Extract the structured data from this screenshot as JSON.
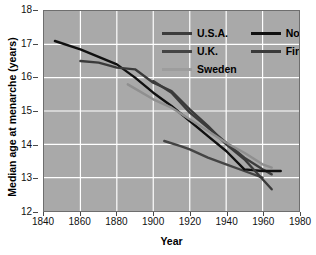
{
  "chart_data": {
    "type": "line",
    "title": "",
    "xlabel": "Year",
    "ylabel": "Median age at menarche (years)",
    "xlim": [
      1840,
      1980
    ],
    "ylim": [
      12,
      18
    ],
    "xticks": [
      1840,
      1860,
      1880,
      1900,
      1920,
      1940,
      1960,
      1980
    ],
    "yticks": [
      12,
      13,
      14,
      15,
      16,
      17,
      18
    ],
    "grid": true,
    "legend_position": "upper right (inside plot)",
    "plot_background": "#a9a9a9",
    "grid_color": "#ffffff",
    "series": [
      {
        "name": "U.S.A.",
        "color": "#3c3c3c",
        "x": [
          1900,
          1910,
          1920,
          1930,
          1940,
          1950,
          1960,
          1965
        ],
        "values": [
          15.9,
          15.55,
          14.95,
          14.5,
          14.05,
          13.6,
          13.25,
          13.1
        ]
      },
      {
        "name": "U.K.",
        "color": "#444444",
        "x": [
          1906,
          1915,
          1920,
          1930,
          1940,
          1950,
          1960
        ],
        "values": [
          14.1,
          13.95,
          13.85,
          13.6,
          13.4,
          13.2,
          13.0
        ]
      },
      {
        "name": "Norway",
        "color": "#101010",
        "x": [
          1846,
          1860,
          1880,
          1890,
          1900,
          1910,
          1920,
          1930,
          1940,
          1950,
          1960,
          1970
        ],
        "values": [
          17.1,
          16.85,
          16.4,
          16.0,
          15.55,
          15.15,
          14.7,
          14.25,
          13.8,
          13.25,
          13.2,
          13.2
        ]
      },
      {
        "name": "Finland",
        "color": "#3a3a3a",
        "x": [
          1860,
          1870,
          1880,
          1890,
          1900,
          1910,
          1920,
          1930,
          1940,
          1950,
          1960,
          1965
        ],
        "values": [
          16.5,
          16.45,
          16.3,
          16.25,
          15.85,
          15.6,
          15.05,
          14.55,
          14.0,
          13.55,
          12.95,
          12.65
        ]
      },
      {
        "name": "Sweden",
        "color": "#8f8f8f",
        "x": [
          1886,
          1900,
          1910,
          1920,
          1930,
          1940,
          1950,
          1960,
          1965
        ],
        "values": [
          15.8,
          15.35,
          15.1,
          14.75,
          14.4,
          14.05,
          13.75,
          13.4,
          13.3
        ]
      }
    ]
  },
  "legend": {
    "entries": [
      {
        "label": "U.S.A.",
        "color": "#3c3c3c"
      },
      {
        "label": "Norway",
        "color": "#101010"
      },
      {
        "label": "U.K.",
        "color": "#444444"
      },
      {
        "label": "Finland",
        "color": "#3a3a3a"
      },
      {
        "label": "Sweden",
        "color": "#9d9d9d"
      }
    ]
  }
}
